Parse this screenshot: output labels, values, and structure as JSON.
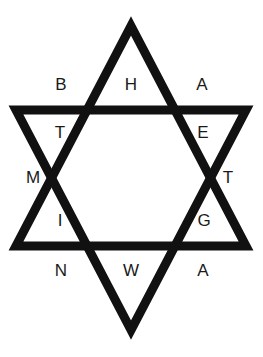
{
  "figure": {
    "shape_name": "six-pointed-star",
    "stroke_color": "#111111",
    "background_color": "#ffffff",
    "fill_color": "none",
    "stroke_width_px": 9,
    "canvas": {
      "width": 263,
      "height": 357
    }
  },
  "letters": [
    {
      "id": "b",
      "char": "B",
      "region": "upper-left-outer",
      "x": 61,
      "y": 76
    },
    {
      "id": "h",
      "char": "H",
      "region": "top-point-inner",
      "x": 131,
      "y": 76
    },
    {
      "id": "a1",
      "char": "A",
      "region": "upper-right-outer",
      "x": 202,
      "y": 76
    },
    {
      "id": "t1",
      "char": "T",
      "region": "upper-left-inner",
      "x": 60,
      "y": 124
    },
    {
      "id": "e",
      "char": "E",
      "region": "upper-right-inner",
      "x": 203,
      "y": 124
    },
    {
      "id": "m",
      "char": "M",
      "region": "left-point-outer",
      "x": 33,
      "y": 169
    },
    {
      "id": "t2",
      "char": "T",
      "region": "right-point-outer",
      "x": 228,
      "y": 169
    },
    {
      "id": "i",
      "char": "I",
      "region": "lower-left-inner",
      "x": 60,
      "y": 212
    },
    {
      "id": "g",
      "char": "G",
      "region": "lower-right-inner",
      "x": 204,
      "y": 212
    },
    {
      "id": "n",
      "char": "N",
      "region": "lower-left-outer",
      "x": 61,
      "y": 262
    },
    {
      "id": "w",
      "char": "W",
      "region": "bottom-point-inner",
      "x": 131,
      "y": 262
    },
    {
      "id": "a2",
      "char": "A",
      "region": "lower-right-outer",
      "x": 203,
      "y": 262
    }
  ],
  "geometry": {
    "up_triangle_points": "131,26 246,246 16,246",
    "down_triangle_points": "131,330 16,110 246,110"
  }
}
